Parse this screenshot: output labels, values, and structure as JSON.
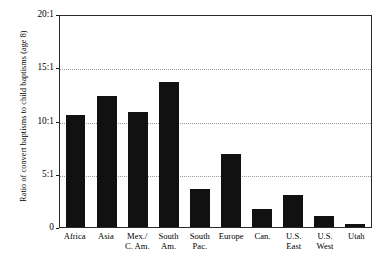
{
  "chart_data": {
    "type": "bar",
    "title": "",
    "subtitle": "",
    "xlabel": "",
    "ylabel": "Ratio of convert baptisms to child baptisms (age 8)",
    "categories": [
      "Africa",
      "Asia",
      "Mex./\nC. Am.",
      "South\nAm.",
      "South\nPac.",
      "Europe",
      "Can.",
      "U.S.\nEast",
      "U.S.\nWest",
      "Utah"
    ],
    "values": [
      10.5,
      12.3,
      10.8,
      13.6,
      3.6,
      6.9,
      1.7,
      3.0,
      1.0,
      0.3
    ],
    "ylim": [
      0,
      20
    ],
    "ytick_values": [
      0,
      5,
      10,
      15,
      20
    ],
    "ytick_labels": [
      "0",
      "5:1",
      "10:1",
      "15:1",
      "20:1"
    ],
    "gridlines": [
      5,
      10,
      15
    ],
    "grid": true,
    "grid_style": "dotted",
    "legend": null,
    "bar_color": "#111111",
    "frame_color": "#2a2a2a",
    "grid_color": "#9a9a9a",
    "background": "#ffffff"
  }
}
